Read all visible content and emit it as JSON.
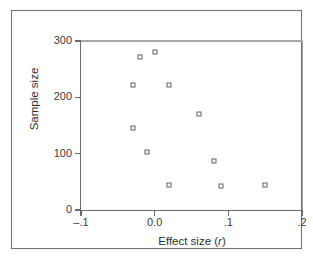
{
  "chart_data": {
    "type": "scatter",
    "title": "",
    "xlabel": "Effect size (r)",
    "xlabel_text": "Effect size (",
    "xlabel_symbol": "r",
    "xlabel_close": ")",
    "ylabel": "Sample size",
    "xlim": [
      -0.1,
      0.2
    ],
    "ylim": [
      0,
      300
    ],
    "xticks": [
      -0.1,
      0.0,
      0.1,
      0.2
    ],
    "xtick_labels": [
      "–.1",
      "0.0",
      ".1",
      ".2"
    ],
    "yticks": [
      0,
      100,
      200,
      300
    ],
    "ytick_labels": [
      "0",
      "100",
      "200",
      "300"
    ],
    "grid": false,
    "legend": null,
    "marker": "open-square",
    "marker_color": "#5f5f63",
    "points": [
      {
        "x": -0.03,
        "y": 222
      },
      {
        "x": -0.02,
        "y": 272
      },
      {
        "x": 0.0,
        "y": 281
      },
      {
        "x": -0.03,
        "y": 146
      },
      {
        "x": -0.01,
        "y": 103
      },
      {
        "x": 0.02,
        "y": 222
      },
      {
        "x": 0.02,
        "y": 44
      },
      {
        "x": 0.06,
        "y": 170
      },
      {
        "x": 0.08,
        "y": 87
      },
      {
        "x": 0.09,
        "y": 43
      },
      {
        "x": 0.15,
        "y": 44
      }
    ]
  },
  "figure": {
    "border_color": "#6e6e70",
    "axis_color": "#6a6a6c",
    "background": "#ffffff"
  }
}
